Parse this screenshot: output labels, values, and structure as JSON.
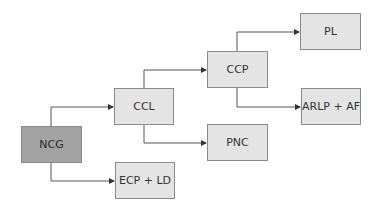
{
  "diagram": {
    "type": "flowchart-tree",
    "nodes": [
      {
        "id": "ncg",
        "label": "NCG",
        "fill": "#a3a3a3"
      },
      {
        "id": "ccl",
        "label": "CCL",
        "fill": "#e4e4e4"
      },
      {
        "id": "ecp_ld",
        "label": "ECP + LD",
        "fill": "#e4e4e4"
      },
      {
        "id": "ccp",
        "label": "CCP",
        "fill": "#e4e4e4"
      },
      {
        "id": "pnc",
        "label": "PNC",
        "fill": "#e4e4e4"
      },
      {
        "id": "pl",
        "label": "PL",
        "fill": "#e4e4e4"
      },
      {
        "id": "arlp_af",
        "label": "ARLP + AF",
        "fill": "#e4e4e4"
      }
    ],
    "edges": [
      {
        "from": "ncg",
        "to": "ccl"
      },
      {
        "from": "ncg",
        "to": "ecp_ld"
      },
      {
        "from": "ccl",
        "to": "ccp"
      },
      {
        "from": "ccl",
        "to": "pnc"
      },
      {
        "from": "ccp",
        "to": "pl"
      },
      {
        "from": "ccp",
        "to": "arlp_af"
      }
    ]
  }
}
